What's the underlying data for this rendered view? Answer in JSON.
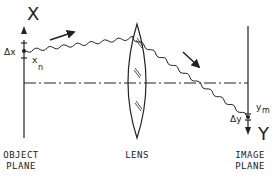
{
  "diagram": {
    "axis_labels": {
      "object_axis": "X",
      "image_axis": "Y"
    },
    "annotations": {
      "object_width": "Δx",
      "object_point": "x",
      "object_point_sub": "n",
      "image_width": "Δy",
      "image_point": "y",
      "image_point_sub": "m"
    },
    "planes": [
      {
        "id": "object",
        "label_line1": "OBJECT",
        "label_line2": "PLANE"
      },
      {
        "id": "lens",
        "label_line1": "LENS",
        "label_line2": ""
      },
      {
        "id": "image",
        "label_line1": "IMAGE",
        "label_line2": "PLANE"
      }
    ],
    "colors": {
      "ink": "#222222",
      "background": "#ffffff"
    }
  }
}
